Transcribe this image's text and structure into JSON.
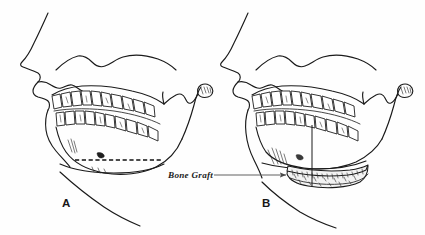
{
  "figure": {
    "background_color": "#fefefe",
    "ink_color": "#1a1a1a",
    "width": 425,
    "height": 235
  },
  "panels": [
    {
      "id": "A",
      "letter": "A",
      "letter_x": 62,
      "letter_y": 207,
      "caption": "A",
      "description": "Pre-operative lateral skull profile showing planned horizontal osteotomy as a dashed line across the mandibular body"
    },
    {
      "id": "B",
      "letter": "B",
      "letter_x": 262,
      "letter_y": 207,
      "caption": "B",
      "description": "Post-operative lateral skull profile with interpositional bone graft placed at the inferior border of the mandible"
    }
  ],
  "annotations": [
    {
      "name": "bone-graft-label",
      "text": "Bone Graft",
      "text_x": 168,
      "text_y": 178,
      "leader_from_x": 214,
      "leader_from_y": 175,
      "leader_to_x": 288,
      "leader_to_y": 175,
      "arrowhead": true,
      "color": "#5a5a5a"
    }
  ],
  "features": {
    "osteotomy_line": {
      "name": "osteotomy-dashed-line",
      "style": "dashed",
      "panel": "A",
      "x_start": 75,
      "x_end": 162,
      "y": 160
    },
    "graft_block": {
      "name": "bone-graft-block",
      "panel": "B",
      "style": "stippled",
      "x_start": 288,
      "x_end": 360,
      "y": 170
    },
    "condyle_hatching": {
      "name": "condyle-hatch-marks",
      "count": 5
    }
  },
  "structures": [
    {
      "name": "facial-profile",
      "label": "Soft tissue facial profile"
    },
    {
      "name": "maxilla",
      "label": "Maxilla"
    },
    {
      "name": "mandible",
      "label": "Mandible"
    },
    {
      "name": "ramus",
      "label": "Mandibular ramus"
    },
    {
      "name": "condyle",
      "label": "Condyle"
    },
    {
      "name": "coronoid-process",
      "label": "Coronoid process"
    },
    {
      "name": "upper-teeth-row",
      "label": "Maxillary teeth"
    },
    {
      "name": "lower-teeth-row",
      "label": "Mandibular teeth"
    },
    {
      "name": "neck-contour",
      "label": "Neck soft tissue contour"
    }
  ]
}
